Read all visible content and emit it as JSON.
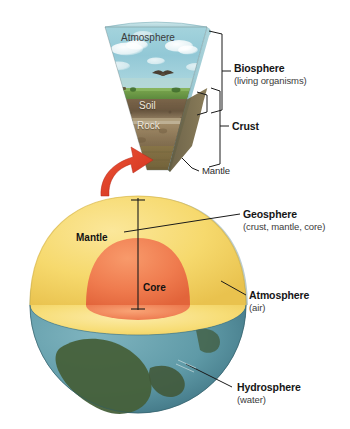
{
  "figure": {
    "background_color": "#ffffff",
    "width": 350,
    "height": 429
  },
  "wedge": {
    "name": "surface-cross-section-wedge",
    "layers": [
      {
        "id": "atmosphere",
        "label": "Atmosphere",
        "color": "#8fc7d4"
      },
      {
        "id": "vegetation",
        "label": "",
        "color": "#6f9a4e"
      },
      {
        "id": "soil",
        "label": "Soil",
        "color": "#6d5a44"
      },
      {
        "id": "rock",
        "label": "Rock",
        "color": "#8d7354"
      },
      {
        "id": "mantle",
        "label": "",
        "color": "#7a6a42"
      }
    ]
  },
  "globe": {
    "name": "earth-cutaway-globe",
    "layers": [
      {
        "id": "mantle",
        "label": "Mantle",
        "color": "#f5d76e"
      },
      {
        "id": "core",
        "label": "Core",
        "color": "#ef7a4f"
      },
      {
        "id": "ocean",
        "label": "",
        "color": "#5e9aa8"
      },
      {
        "id": "land",
        "label": "",
        "color": "#46603a"
      }
    ]
  },
  "callouts": [
    {
      "id": "biosphere",
      "title": "Biosphere",
      "subtitle": "(living organisms)",
      "marker": "bracket"
    },
    {
      "id": "crust",
      "title": "Crust",
      "subtitle": "",
      "marker": "bracket"
    },
    {
      "id": "mantle-wedge",
      "title": "Mantle",
      "subtitle": "",
      "marker": "leader-line",
      "style": "plain"
    },
    {
      "id": "geosphere",
      "title": "Geosphere",
      "subtitle": "(crust, mantle, core)",
      "marker": "leader-line"
    },
    {
      "id": "atmosphere",
      "title": "Atmosphere",
      "subtitle": "(air)",
      "marker": "leader-line"
    },
    {
      "id": "hydrosphere",
      "title": "Hydrosphere",
      "subtitle": "(water)",
      "marker": "leader-line"
    }
  ],
  "labels": {
    "wedge_atmosphere": "Atmosphere",
    "wedge_soil": "Soil",
    "wedge_rock": "Rock",
    "wedge_mantle_callout": "Mantle",
    "globe_mantle": "Mantle",
    "globe_core": "Core",
    "biosphere_title": "Biosphere",
    "biosphere_sub": "(living organisms)",
    "crust_title": "Crust",
    "geosphere_title": "Geosphere",
    "geosphere_sub": "(crust, mantle, core)",
    "atmosphere_title": "Atmosphere",
    "atmosphere_sub": "(air)",
    "hydrosphere_title": "Hydrosphere",
    "hydrosphere_sub": "(water)"
  },
  "colors": {
    "sky": "#8fc7d4",
    "grass": "#6f9a4e",
    "soil": "#6d5a44",
    "rock": "#8d7354",
    "mantle_wedge": "#7a6a42",
    "mantle": "#f5d76e",
    "core": "#ef7a4f",
    "ocean": "#5e9aa8",
    "land": "#46603a",
    "arrow": "#df3f28",
    "line": "#1a1a1a",
    "text": "#161616",
    "text_sub": "#3c3c3c"
  }
}
